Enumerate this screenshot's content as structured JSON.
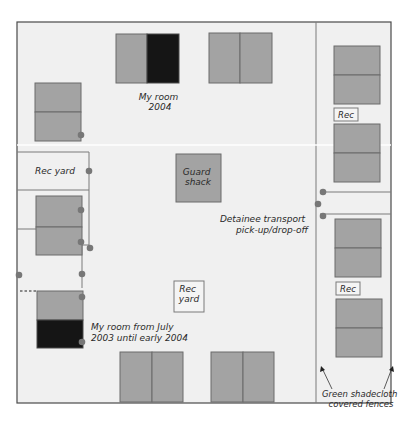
{
  "diagram": {
    "type": "floor-plan",
    "colors": {
      "background": "#ffffff",
      "compound": "#f0f0f0",
      "room": "#a3a3a3",
      "highlight_room": "#151515",
      "outline": "#555555",
      "door": "#777777"
    },
    "labels": {
      "my_room_2004": [
        "My room",
        "2004"
      ],
      "guard_shack": [
        "Guard",
        "shack"
      ],
      "rec_yard_left": "Rec yard",
      "rec_yard_center": [
        "Rec",
        "yard"
      ],
      "rec_top": "Rec",
      "rec_bottom": "Rec",
      "detainee_transport": [
        "Detainee transport",
        "pick-up/drop-off"
      ],
      "my_room_2003": [
        "My room from July",
        "2003 until early 2004"
      ],
      "fences": [
        "Green shadecloth",
        "covered fences"
      ]
    }
  }
}
